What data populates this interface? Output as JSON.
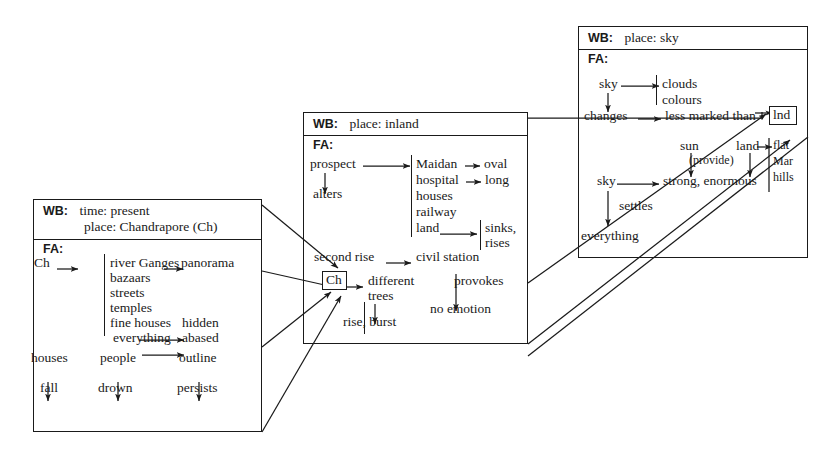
{
  "diagram": {
    "notation": {
      "wb_label": "WB:",
      "fa_label": "FA:"
    }
  },
  "boxes": [
    {
      "id": "chandrapore",
      "wb": {
        "label": "WB:",
        "lines": [
          "time: present",
          "place: Chandrapore  (Ch)"
        ]
      },
      "fa": {
        "label": "FA:"
      },
      "nodes": [
        {
          "id": "ch",
          "text": "Ch"
        },
        {
          "id": "river",
          "text": "river Ganges"
        },
        {
          "id": "panorama",
          "text": "panorama"
        },
        {
          "id": "bazaars",
          "text": "bazaars"
        },
        {
          "id": "streets",
          "text": "streets"
        },
        {
          "id": "temples",
          "text": "temples"
        },
        {
          "id": "finehouses",
          "text": "fine houses"
        },
        {
          "id": "hidden",
          "text": "hidden"
        },
        {
          "id": "everything",
          "text": "everything"
        },
        {
          "id": "abased",
          "text": "abased"
        },
        {
          "id": "houses",
          "text": "houses"
        },
        {
          "id": "fall",
          "text": "fall"
        },
        {
          "id": "people",
          "text": "people"
        },
        {
          "id": "drown",
          "text": "drown"
        },
        {
          "id": "outline",
          "text": "outline"
        },
        {
          "id": "persists",
          "text": "persists"
        }
      ]
    },
    {
      "id": "inland",
      "wb": {
        "label": "WB:",
        "lines": [
          "place: inland"
        ]
      },
      "fa": {
        "label": "FA:"
      },
      "nodes": [
        {
          "id": "prospect",
          "text": "prospect"
        },
        {
          "id": "alters",
          "text": "alters"
        },
        {
          "id": "maidan",
          "text": "Maidan"
        },
        {
          "id": "oval",
          "text": "oval"
        },
        {
          "id": "hospital",
          "text": "hospital"
        },
        {
          "id": "long",
          "text": "long"
        },
        {
          "id": "houses2",
          "text": "houses"
        },
        {
          "id": "railway",
          "text": "railway"
        },
        {
          "id": "land",
          "text": "land"
        },
        {
          "id": "sinks",
          "text": "sinks,"
        },
        {
          "id": "rises",
          "text": "rises"
        },
        {
          "id": "secondrise",
          "text": "second rise"
        },
        {
          "id": "civilstation",
          "text": "civil station"
        },
        {
          "id": "chbox",
          "text": "Ch"
        },
        {
          "id": "different",
          "text": "different"
        },
        {
          "id": "trees",
          "text": "trees"
        },
        {
          "id": "riseburst",
          "text": "rise, burst"
        },
        {
          "id": "provokes",
          "text": "provokes"
        },
        {
          "id": "noemotion",
          "text": "no emotion"
        }
      ]
    },
    {
      "id": "sky",
      "wb": {
        "label": "WB:",
        "lines": [
          "place: sky"
        ]
      },
      "fa": {
        "label": "FA:"
      },
      "nodes": [
        {
          "id": "sky1",
          "text": "sky"
        },
        {
          "id": "clouds",
          "text": "clouds"
        },
        {
          "id": "colours",
          "text": "colours"
        },
        {
          "id": "changes",
          "text": "changes"
        },
        {
          "id": "lessmarked",
          "text": "less marked than"
        },
        {
          "id": "lnd",
          "text": "lnd"
        },
        {
          "id": "sun",
          "text": "sun"
        },
        {
          "id": "provide",
          "text": "(provide)"
        },
        {
          "id": "land2",
          "text": "land"
        },
        {
          "id": "flat",
          "text": "flat"
        },
        {
          "id": "mar",
          "text": "Mar"
        },
        {
          "id": "hills",
          "text": "hills"
        },
        {
          "id": "sky2",
          "text": "sky"
        },
        {
          "id": "strong",
          "text": "strong, enormous"
        },
        {
          "id": "settles",
          "text": "settles"
        },
        {
          "id": "everything2",
          "text": "everything"
        }
      ]
    }
  ],
  "colors": {
    "ink": "#1a1a1a",
    "paper": "#ffffff"
  }
}
